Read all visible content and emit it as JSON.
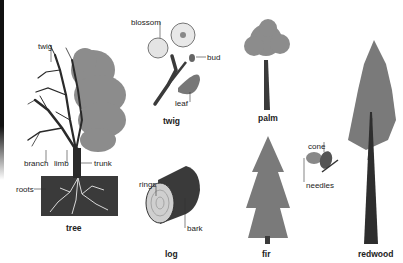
{
  "diagram": {
    "subjects": [
      {
        "id": "tree",
        "caption": "tree",
        "labels": [
          "twig",
          "branch",
          "limb",
          "trunk",
          "roots"
        ]
      },
      {
        "id": "twig",
        "caption": "twig",
        "labels": [
          "blossom",
          "bud",
          "leaf"
        ]
      },
      {
        "id": "log",
        "caption": "log",
        "labels": [
          "rings",
          "bark"
        ]
      },
      {
        "id": "palm",
        "caption": "palm",
        "labels": []
      },
      {
        "id": "fir",
        "caption": "fir",
        "labels": [
          "cone",
          "needles"
        ]
      },
      {
        "id": "redwood",
        "caption": "redwood",
        "labels": []
      }
    ],
    "colors": {
      "foliage": "#8a8a8a",
      "wood": "#2a2a2a",
      "soil": "#3a3a3a",
      "text": "#222222",
      "background": "#ffffff"
    }
  }
}
